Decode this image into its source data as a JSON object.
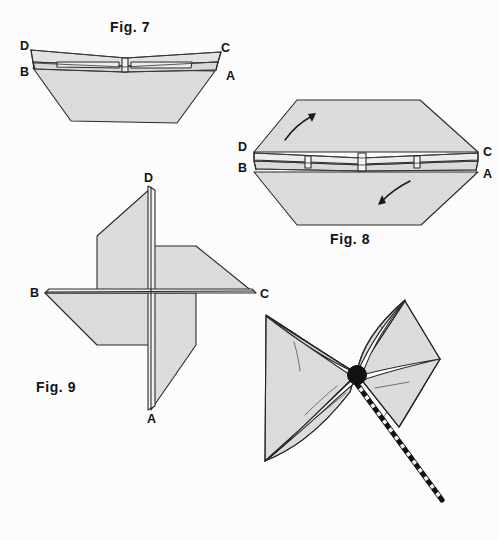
{
  "page": {
    "background_color": "#fdfdfd",
    "paper_fill_color": "#dcdcdc",
    "paper_fill_light": "#e6e6e6",
    "ink_color": "#2a2a2a",
    "width": 498,
    "height": 540
  },
  "figures": [
    {
      "id": "fig7",
      "caption": "Fig. 7",
      "caption_x": 110,
      "caption_y": 32,
      "description": "Folded square seen edge-on, flaps pulled outward, labelled D, C, B, A",
      "labels": [
        {
          "text": "D",
          "x": 20,
          "y": 50
        },
        {
          "text": "C",
          "x": 221,
          "y": 52
        },
        {
          "text": "B",
          "x": 20,
          "y": 76
        },
        {
          "text": "A",
          "x": 226,
          "y": 80
        }
      ]
    },
    {
      "id": "fig8",
      "caption": "Fig. 8",
      "caption_x": 330,
      "caption_y": 244,
      "description": "Opened hexagonal form with two curved rotation arrows, labelled D, C, B, A",
      "labels": [
        {
          "text": "D",
          "x": 240,
          "y": 150
        },
        {
          "text": "C",
          "x": 485,
          "y": 155
        },
        {
          "text": "B",
          "x": 240,
          "y": 170
        },
        {
          "text": "A",
          "x": 485,
          "y": 176
        }
      ]
    },
    {
      "id": "fig9",
      "caption": "Fig. 9",
      "caption_x": 36,
      "caption_y": 392,
      "description": "Four-bladed pinwheel seen flat, corners labelled D (top), A (bottom), B (left), C (right)",
      "labels": [
        {
          "text": "D",
          "x": 146,
          "y": 182
        },
        {
          "text": "B",
          "x": 32,
          "y": 297
        },
        {
          "text": "C",
          "x": 260,
          "y": 298
        },
        {
          "text": "A",
          "x": 149,
          "y": 416
        }
      ]
    },
    {
      "id": "finished-pinwheel",
      "caption": "",
      "description": "Completed pinwheel with black hub pin and striped stick",
      "labels": []
    }
  ],
  "colors": {
    "paper": "#dcdcdc",
    "paper_highlight": "#ebebeb",
    "outline": "#2a2a2a",
    "hub": "#111111",
    "stick_dark": "#111111",
    "stick_light": "#f4f4f4"
  }
}
